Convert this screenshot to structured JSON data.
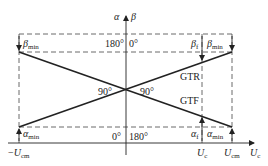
{
  "diagram": {
    "type": "phase-shift-characteristic",
    "axes": {
      "vertical_labels": {
        "alpha": "α",
        "beta": "β"
      },
      "horizontal_label": {
        "main": "U",
        "sub": "c"
      }
    },
    "lines": {
      "rising": "GTR",
      "falling": "GTF"
    },
    "angle_marks": {
      "top_left": "180°",
      "top_right": "0°",
      "bottom_left": "0°",
      "bottom_right": "180°",
      "cross_left": "90°",
      "cross_right": "90°"
    },
    "labels": {
      "beta_min_left": {
        "main": "β",
        "sub": "min"
      },
      "beta_min_right": {
        "main": "β",
        "sub": "min"
      },
      "beta_f": {
        "main": "β",
        "sub": "f"
      },
      "alpha_min_left": {
        "main": "α",
        "sub": "min"
      },
      "alpha_min_right": {
        "main": "α",
        "sub": "min"
      },
      "alpha_f": {
        "main": "α",
        "sub": "f"
      },
      "neg_ucm": {
        "prefix": "−",
        "main": "U",
        "sub": "cm"
      },
      "uc": {
        "main": "U",
        "sub": "c"
      },
      "ucm": {
        "main": "U",
        "sub": "cm"
      }
    },
    "colors": {
      "line": "#222222",
      "dash": "#444444"
    }
  }
}
